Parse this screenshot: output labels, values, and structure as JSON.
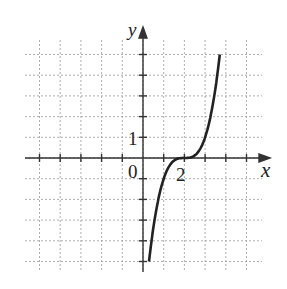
{
  "chart_data": {
    "type": "line",
    "title": "",
    "xlabel": "x",
    "ylabel": "y",
    "function": "y = (x - 2)^3",
    "xlim": [
      -5,
      5
    ],
    "ylim": [
      -5,
      5
    ],
    "grid": true,
    "tick_labels": {
      "origin": "0",
      "x": [
        "2"
      ],
      "y": [
        "1"
      ]
    },
    "series": [
      {
        "name": "curve",
        "x": [
          0.29,
          0.5,
          1,
          1.5,
          2,
          2.5,
          3,
          3.5,
          3.71
        ],
        "y": [
          -5,
          -3.375,
          -1,
          -0.125,
          0,
          0.125,
          1,
          3.375,
          5
        ]
      }
    ]
  },
  "labels": {
    "x_axis": "x",
    "y_axis": "y",
    "origin": "0",
    "x_tick": "2",
    "y_tick": "1"
  },
  "colors": {
    "curve": "#222222",
    "grid": "#9a9a9a",
    "axes": "#333333"
  }
}
